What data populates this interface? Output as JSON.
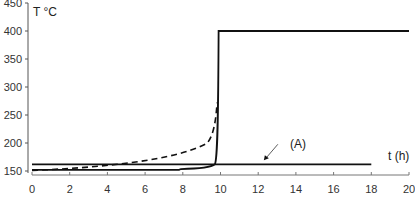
{
  "chart_data": {
    "type": "line",
    "title": "",
    "xlabel": "t (h)",
    "ylabel": "T °C",
    "xlim": [
      0,
      20
    ],
    "ylim": [
      150,
      450
    ],
    "x_ticks": [
      0,
      2,
      4,
      6,
      8,
      10,
      12,
      14,
      16,
      18,
      20
    ],
    "y_ticks": [
      150,
      200,
      250,
      300,
      350,
      400,
      450
    ],
    "grid": false,
    "legend": null,
    "annotations": [
      {
        "text": "(A)",
        "arrow_to": {
          "x": 12.3,
          "y": 162
        },
        "label_pos": {
          "x": 13.2,
          "y": 188
        }
      }
    ],
    "series": [
      {
        "name": "solid-runaway",
        "style": "solid",
        "x": [
          0,
          7.8,
          8.0,
          9.0,
          9.5,
          9.7,
          9.8,
          9.85,
          9.9,
          10.0,
          20
        ],
        "y": [
          152,
          152,
          154,
          156,
          160,
          168,
          200,
          300,
          400,
          400,
          400
        ]
      },
      {
        "name": "dashed",
        "style": "dashed",
        "x": [
          0,
          2,
          4,
          6,
          7,
          8,
          9,
          9.5,
          9.7,
          9.8
        ],
        "y": [
          152,
          155,
          159,
          165,
          170,
          178,
          195,
          215,
          240,
          270
        ]
      },
      {
        "name": "A",
        "style": "solid",
        "x": [
          0,
          18
        ],
        "y": [
          162,
          162
        ]
      }
    ]
  },
  "axes": {
    "y_label": "T °C",
    "x_label": "t (h)",
    "annotation_label": "(A)"
  }
}
